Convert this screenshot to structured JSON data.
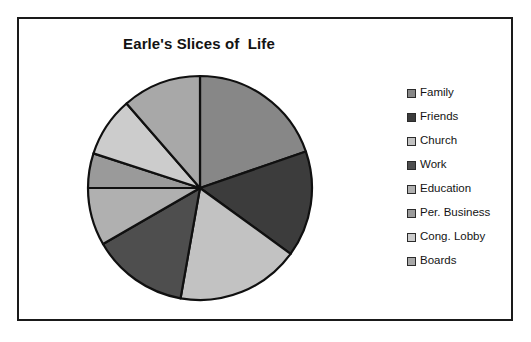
{
  "chart": {
    "title": "Earle's Slices of  Life",
    "frame_border_color": "#1a1a1a",
    "background_color": "#ffffff",
    "text_color": "#141414"
  },
  "legend": {
    "position": "right",
    "items": [
      {
        "label": "Family",
        "color": "#878787",
        "swatch_name": "legend-swatch-family"
      },
      {
        "label": "Friends",
        "color": "#3c3c3c",
        "swatch_name": "legend-swatch-friends"
      },
      {
        "label": "Church",
        "color": "#c2c2c2",
        "swatch_name": "legend-swatch-church"
      },
      {
        "label": "Work",
        "color": "#4e4e4e",
        "swatch_name": "legend-swatch-work"
      },
      {
        "label": "Education",
        "color": "#b0b0b0",
        "swatch_name": "legend-swatch-education"
      },
      {
        "label": "Per. Business",
        "color": "#9a9a9a",
        "swatch_name": "legend-swatch-per-business"
      },
      {
        "label": "Cong. Lobby",
        "color": "#cccccc",
        "swatch_name": "legend-swatch-cong-lobby"
      },
      {
        "label": "Boards",
        "color": "#a8a8a8",
        "swatch_name": "legend-swatch-boards"
      }
    ]
  },
  "chart_data": {
    "type": "pie",
    "title": "Earle's Slices of  Life",
    "xlabel": "",
    "ylabel": "",
    "grid": false,
    "legend_position": "right",
    "start_angle_deg": 0,
    "direction": "clockwise",
    "center": {
      "x": 115,
      "y": 115
    },
    "radius": 112,
    "categories": [
      "Family",
      "Friends",
      "Church",
      "Work",
      "Education",
      "Per. Business",
      "Cong. Lobby",
      "Boards"
    ],
    "values": [
      19.7,
      15.3,
      17.8,
      13.9,
      8.3,
      5.0,
      8.6,
      11.4
    ],
    "angles_deg": [
      71,
      55,
      64,
      50,
      30,
      18,
      31,
      41
    ],
    "boundaries_deg": [
      0,
      71,
      126,
      190,
      240,
      270,
      288,
      319,
      360
    ],
    "colors": [
      "#878787",
      "#3c3c3c",
      "#c2c2c2",
      "#4e4e4e",
      "#b0b0b0",
      "#9a9a9a",
      "#cccccc",
      "#a8a8a8"
    ],
    "slice_outline_color": "#101010",
    "slice_outline_width": 2.2
  }
}
